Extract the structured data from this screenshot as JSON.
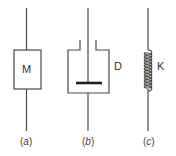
{
  "diagram": {
    "type": "mechanical-elements",
    "stroke_color": "#4a4a4a",
    "elements": [
      {
        "id": "a",
        "kind": "mass",
        "label": "M",
        "caption_open": "(",
        "caption_letter": "a",
        "caption_close": ")"
      },
      {
        "id": "b",
        "kind": "damper",
        "label": "D",
        "caption_open": "(",
        "caption_letter": "b",
        "caption_close": ")"
      },
      {
        "id": "c",
        "kind": "spring",
        "label": "K",
        "caption_open": "(",
        "caption_letter": "c",
        "caption_close": ")"
      }
    ]
  }
}
